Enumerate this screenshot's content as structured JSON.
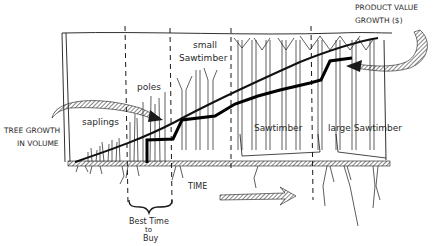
{
  "diagram": {
    "stages": [
      {
        "label": "saplings"
      },
      {
        "label": "poles"
      },
      {
        "label_line1": "small",
        "label_line2": "Sawtimber"
      },
      {
        "label": "Sawtimber"
      },
      {
        "label": "large Sawtimber"
      }
    ],
    "left_label": {
      "line1": "TREE GROWTH",
      "line2": "IN VOLUME"
    },
    "right_label": {
      "line1": "PRODUCT VALUE",
      "line2": "GROWTH ($)"
    },
    "x_axis_label": "TIME",
    "best_time": {
      "line1": "Best Time",
      "line2": "to",
      "line3": "Buy"
    },
    "series": [
      {
        "name": "Tree growth in volume",
        "style": "thin line, smooth rising curve"
      },
      {
        "name": "Product value growth ($)",
        "style": "thick stepped line"
      }
    ],
    "colors": {
      "ink": "#1a1a1a",
      "paper": "#ffffff",
      "hatch": "#555555"
    }
  }
}
